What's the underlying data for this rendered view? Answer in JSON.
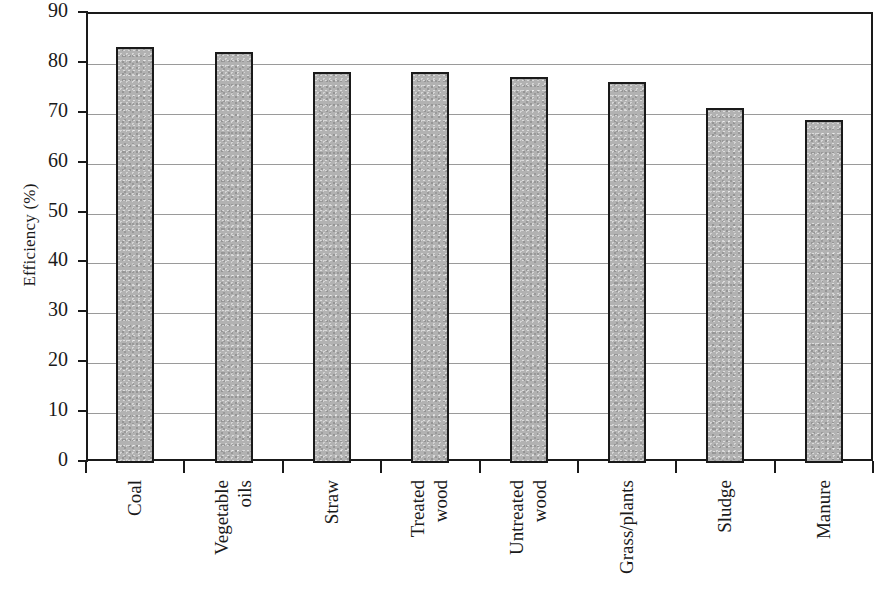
{
  "chart_data": {
    "type": "bar",
    "title": "",
    "subtitle": "",
    "xlabel": "",
    "ylabel": "Efficiency (%)",
    "ylim": [
      0,
      90
    ],
    "ytick_step": 10,
    "yticks": [
      "90",
      "80",
      "70",
      "60",
      "50",
      "40",
      "30",
      "20",
      "10",
      "0"
    ],
    "grid": true,
    "legend": null,
    "bar_fill_color": "#b2b2b2",
    "bar_edge_color": "#1a1a1a",
    "categories": [
      "Coal",
      "Vegetable oils",
      "Straw",
      "Treated wood",
      "Untreated wood",
      "Grass/plants",
      "Sludge",
      "Manure"
    ],
    "category_lines": [
      [
        "Coal"
      ],
      [
        "Vegetable",
        "oils"
      ],
      [
        "Straw"
      ],
      [
        "Treated",
        "wood"
      ],
      [
        "Untreated",
        "wood"
      ],
      [
        "Grass/plants"
      ],
      [
        "Sludge"
      ],
      [
        "Manure"
      ]
    ],
    "values": [
      83,
      82,
      78,
      78,
      77,
      76,
      70.8,
      68.4
    ]
  }
}
